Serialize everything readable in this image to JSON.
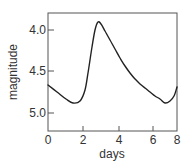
{
  "chart_data": {
    "type": "line",
    "title": "",
    "xlabel": "days",
    "ylabel": "magnitude",
    "xlim": [
      0,
      8
    ],
    "ylim": [
      5.22,
      3.79
    ],
    "y_inverted": true,
    "grid": false,
    "legend": null,
    "x_ticks": [
      {
        "value": 0,
        "label": "0",
        "px": 48
      },
      {
        "value": 2,
        "label": "2",
        "px": 83
      },
      {
        "value": 4,
        "label": "4",
        "px": 119
      },
      {
        "value": 6,
        "label": "6",
        "px": 153
      },
      {
        "value": 8,
        "label": "8",
        "px": 177
      }
    ],
    "y_ticks": [
      {
        "value": 4.0,
        "label": "4.0",
        "py": 30
      },
      {
        "value": 4.5,
        "label": "4.5",
        "py": 71
      },
      {
        "value": 5.0,
        "label": "5.0",
        "py": 113
      }
    ],
    "series": [
      {
        "name": "light curve",
        "color": "#222222",
        "x": [
          0,
          0.5,
          1.0,
          1.4,
          1.8,
          2.3,
          2.6,
          2.9,
          3.2,
          3.6,
          4.1,
          4.7,
          5.3,
          5.9,
          6.4,
          6.7,
          7.2,
          8.0
        ],
        "y": [
          4.66,
          4.74,
          4.83,
          4.88,
          4.85,
          4.52,
          4.15,
          3.9,
          3.96,
          4.12,
          4.34,
          4.52,
          4.65,
          4.76,
          4.84,
          4.88,
          4.86,
          4.69
        ]
      }
    ],
    "curve_px": [
      [
        48,
        85
      ],
      [
        57,
        92
      ],
      [
        66,
        99
      ],
      [
        73,
        103
      ],
      [
        80,
        101
      ],
      [
        85,
        90
      ],
      [
        88,
        73
      ],
      [
        92,
        47
      ],
      [
        95,
        30
      ],
      [
        98,
        22
      ],
      [
        101,
        24
      ],
      [
        105,
        31
      ],
      [
        110,
        40
      ],
      [
        115,
        49
      ],
      [
        120,
        58
      ],
      [
        125,
        66
      ],
      [
        130,
        73
      ],
      [
        135,
        79
      ],
      [
        140,
        84
      ],
      [
        145,
        88
      ],
      [
        150,
        92
      ],
      [
        155,
        96
      ],
      [
        160,
        99
      ],
      [
        165,
        103
      ],
      [
        170,
        101
      ],
      [
        174,
        96
      ],
      [
        177,
        87
      ]
    ]
  },
  "frame": {
    "left": 48,
    "top": 13,
    "right": 177,
    "bottom": 131
  },
  "colors": {
    "axis": "#555555",
    "line": "#222222",
    "text": "#333333"
  }
}
